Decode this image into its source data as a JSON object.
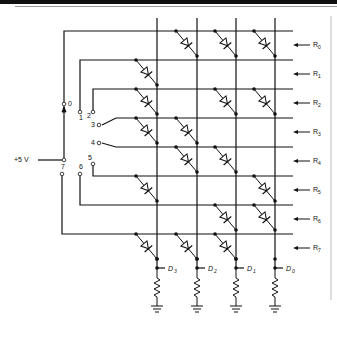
{
  "diagram": {
    "supply_label": "+5 V",
    "switch_positions": [
      "0",
      "1",
      "2",
      "3",
      "4",
      "5",
      "6",
      "7"
    ],
    "rows": [
      {
        "label": "R",
        "sub": "0",
        "diodes": [
          0,
          1,
          1,
          1
        ]
      },
      {
        "label": "R",
        "sub": "1",
        "diodes": [
          1,
          0,
          0,
          0
        ]
      },
      {
        "label": "R",
        "sub": "2",
        "diodes": [
          1,
          0,
          1,
          1
        ]
      },
      {
        "label": "R",
        "sub": "3",
        "diodes": [
          1,
          1,
          0,
          0
        ]
      },
      {
        "label": "R",
        "sub": "4",
        "diodes": [
          0,
          1,
          1,
          0
        ]
      },
      {
        "label": "R",
        "sub": "5",
        "diodes": [
          1,
          0,
          0,
          1
        ]
      },
      {
        "label": "R",
        "sub": "6",
        "diodes": [
          0,
          0,
          1,
          1
        ]
      },
      {
        "label": "R",
        "sub": "7",
        "diodes": [
          1,
          1,
          1,
          0
        ]
      }
    ],
    "columns": [
      {
        "label": "D",
        "sub": "3"
      },
      {
        "label": "D",
        "sub": "2"
      },
      {
        "label": "D",
        "sub": "1"
      },
      {
        "label": "D",
        "sub": "0"
      }
    ],
    "icons": {
      "diode": "diode-icon",
      "resistor": "resistor-icon",
      "ground": "ground-icon",
      "arrow": "arrow-left-icon"
    },
    "colors": {
      "line": "#111111",
      "background": "#ffffff"
    }
  }
}
